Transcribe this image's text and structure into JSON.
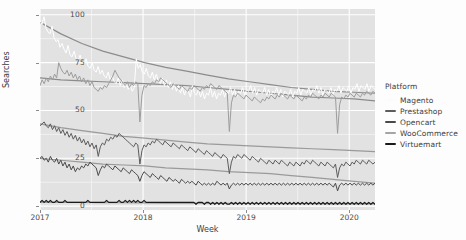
{
  "chart_data": {
    "type": "line",
    "title": "",
    "xlabel": "Week",
    "ylabel": "Searches",
    "xlim": [
      2017.0,
      2020.25
    ],
    "ylim": [
      -2,
      103
    ],
    "xticks": [
      "2017",
      "2018",
      "2019",
      "2020"
    ],
    "xtick_values": [
      2017,
      2018,
      2019,
      2020
    ],
    "yticks": [
      "0",
      "25",
      "50",
      "75",
      "100"
    ],
    "ytick_values": [
      0,
      25,
      50,
      75,
      100
    ],
    "grid": "white major and minor horizontal/vertical gridlines on gray panel",
    "legend_position": "right",
    "legend_title": "Platform",
    "panel_background": "#e2e2e2",
    "series": [
      {
        "name": "Magento",
        "color": "#ffffff",
        "trend_color": "#8c8c8c",
        "trend": [
          96,
          90,
          85,
          81,
          78,
          75,
          72.5,
          70.5,
          68.5,
          66.5,
          65,
          63.5,
          62,
          61,
          60,
          59.5,
          59
        ],
        "values": [
          97,
          95,
          99,
          93,
          91,
          90,
          94,
          88,
          86,
          87,
          83,
          85,
          82,
          80,
          84,
          79,
          78,
          81,
          77,
          76,
          79,
          75,
          74,
          77,
          73,
          72,
          75,
          71,
          70,
          73,
          69,
          71,
          68,
          67,
          70,
          66,
          68,
          65,
          64,
          67,
          63,
          66,
          62,
          64,
          61,
          63,
          60,
          62,
          77,
          72,
          74,
          70,
          69,
          72,
          68,
          67,
          70,
          66,
          69,
          65,
          64,
          67,
          63,
          66,
          62,
          65,
          61,
          64,
          60,
          63,
          59,
          62,
          58,
          61,
          60,
          57,
          63,
          59,
          58,
          61,
          57,
          60,
          56,
          59,
          58,
          62,
          57,
          60,
          56,
          59,
          58,
          61,
          57,
          60,
          59,
          62,
          58,
          61,
          57,
          60,
          59,
          62,
          58,
          61,
          60,
          63,
          59,
          62,
          58,
          61,
          60,
          59,
          62,
          58,
          61,
          57,
          60,
          59,
          62,
          58,
          61,
          57,
          60,
          59,
          58,
          61,
          57,
          60,
          59,
          62,
          58,
          61,
          60,
          59,
          62,
          58,
          61,
          60,
          63,
          59,
          62,
          58,
          61,
          60,
          59,
          62,
          58,
          61,
          60,
          63,
          59,
          62,
          61,
          60,
          63,
          59,
          62,
          61,
          64,
          60,
          63,
          62,
          61,
          64,
          60,
          63,
          62,
          61
        ]
      },
      {
        "name": "Prestashop",
        "color": "#5c5c5c",
        "trend_color": "#9a9a9a",
        "trend": [
          43,
          41,
          39.5,
          38,
          36.5,
          35.5,
          34.5,
          33.5,
          32.5,
          32,
          31.5,
          31,
          30.5,
          30,
          29.5,
          29,
          28.5
        ],
        "values": [
          42,
          43,
          44,
          42,
          41,
          43,
          40,
          42,
          39,
          41,
          38,
          40,
          37,
          39,
          36,
          38,
          35,
          37,
          34,
          36,
          33,
          35,
          32,
          34,
          31,
          33,
          30,
          32,
          26,
          31,
          33,
          32,
          35,
          34,
          36,
          35,
          37,
          36,
          38,
          37,
          36,
          35,
          34,
          33,
          32,
          31,
          33,
          32,
          22,
          29,
          32,
          31,
          33,
          32,
          34,
          33,
          35,
          34,
          33,
          32,
          34,
          33,
          32,
          31,
          33,
          32,
          31,
          30,
          32,
          31,
          30,
          29,
          31,
          30,
          29,
          28,
          30,
          29,
          28,
          27,
          29,
          28,
          27,
          26,
          28,
          27,
          26,
          25,
          27,
          26,
          25,
          17,
          23,
          26,
          25,
          27,
          26,
          25,
          27,
          26,
          25,
          24,
          26,
          25,
          24,
          23,
          25,
          24,
          23,
          22,
          24,
          23,
          22,
          24,
          23,
          22,
          24,
          23,
          22,
          21,
          23,
          22,
          21,
          23,
          22,
          21,
          23,
          22,
          24,
          23,
          22,
          24,
          23,
          22,
          21,
          23,
          22,
          21,
          23,
          22,
          21,
          20,
          22,
          15,
          20,
          22,
          21,
          23,
          22,
          21,
          23,
          22,
          24,
          23,
          22,
          24,
          23,
          22,
          24,
          23,
          22,
          23
        ]
      },
      {
        "name": "Opencart",
        "color": "#4a4a4a",
        "trend_color": "#9a9a9a",
        "trend": [
          25,
          24,
          23,
          22,
          21.5,
          21,
          20,
          19.5,
          19,
          18,
          17.5,
          17,
          16,
          15,
          14,
          13,
          12
        ],
        "values": [
          25,
          26,
          24,
          25,
          23,
          26,
          24,
          23,
          25,
          22,
          24,
          21,
          23,
          20,
          22,
          19,
          21,
          18,
          20,
          19,
          21,
          20,
          22,
          21,
          23,
          22,
          21,
          20,
          16,
          19,
          21,
          20,
          22,
          21,
          20,
          19,
          21,
          20,
          19,
          18,
          20,
          19,
          18,
          17,
          19,
          18,
          17,
          16,
          13,
          16,
          18,
          17,
          16,
          15,
          17,
          16,
          15,
          14,
          16,
          15,
          14,
          13,
          15,
          14,
          13,
          14,
          13,
          12,
          14,
          13,
          12,
          13,
          12,
          13,
          12,
          11,
          13,
          12,
          11,
          12,
          11,
          12,
          11,
          12,
          11,
          13,
          12,
          11,
          12,
          11,
          12,
          9,
          11,
          12,
          11,
          12,
          11,
          12,
          11,
          12,
          11,
          12,
          11,
          12,
          11,
          12,
          11,
          12,
          11,
          12,
          11,
          12,
          11,
          12,
          11,
          12,
          11,
          12,
          11,
          12,
          11,
          12,
          11,
          12,
          11,
          12,
          11,
          12,
          11,
          12,
          11,
          12,
          11,
          12,
          11,
          12,
          11,
          12,
          11,
          12,
          11,
          10,
          12,
          8,
          11,
          12,
          11,
          12,
          11,
          12,
          11,
          12,
          11,
          12,
          11,
          12,
          11,
          12,
          11,
          12,
          11,
          12
        ]
      },
      {
        "name": "WooCommerce",
        "color": "#9d9d9d",
        "trend_color": "#8c8c8c",
        "trend": [
          67,
          66,
          65.5,
          65,
          64.5,
          64,
          63.5,
          63,
          62,
          61,
          60,
          59,
          58,
          57,
          56.5,
          56,
          55
        ],
        "values": [
          63,
          66,
          64,
          67,
          65,
          68,
          66,
          69,
          67,
          75,
          72,
          70,
          69,
          71,
          68,
          70,
          67,
          69,
          66,
          68,
          65,
          67,
          64,
          66,
          63,
          65,
          62,
          61,
          60,
          62,
          61,
          63,
          62,
          64,
          66,
          68,
          71,
          69,
          67,
          66,
          64,
          63,
          65,
          62,
          64,
          63,
          65,
          64,
          44,
          58,
          63,
          62,
          64,
          63,
          65,
          64,
          66,
          65,
          67,
          66,
          65,
          64,
          63,
          62,
          64,
          63,
          62,
          61,
          63,
          62,
          61,
          60,
          62,
          61,
          63,
          62,
          61,
          60,
          62,
          61,
          63,
          62,
          64,
          63,
          62,
          61,
          63,
          62,
          61,
          60,
          59,
          39,
          54,
          58,
          57,
          59,
          58,
          57,
          56,
          58,
          57,
          56,
          55,
          57,
          56,
          55,
          54,
          56,
          55,
          57,
          56,
          58,
          57,
          56,
          58,
          57,
          59,
          58,
          57,
          56,
          58,
          57,
          56,
          58,
          57,
          56,
          55,
          57,
          56,
          58,
          57,
          59,
          58,
          57,
          56,
          58,
          57,
          59,
          58,
          57,
          59,
          58,
          57,
          38,
          53,
          57,
          56,
          58,
          57,
          59,
          58,
          57,
          59,
          58,
          57,
          59,
          58,
          60,
          59,
          58,
          60,
          59
        ]
      },
      {
        "name": "Virtuemart",
        "color": "#1a1a1a",
        "trend_color": "#9a9a9a",
        "trend": [
          2,
          2,
          2,
          1.8,
          1.8,
          1.7,
          1.6,
          1.6,
          1.5,
          1.5,
          1.4,
          1.4,
          1.3,
          1.3,
          1.2,
          1.2,
          1.2
        ],
        "values": [
          2,
          3,
          2,
          3,
          2,
          3,
          2,
          2,
          3,
          2,
          2,
          2,
          3,
          2,
          2,
          2,
          2,
          2,
          2,
          2,
          2,
          2,
          2,
          3,
          2,
          2,
          2,
          2,
          2,
          2,
          2,
          2,
          3,
          2,
          2,
          2,
          2,
          2,
          3,
          2,
          2,
          3,
          2,
          3,
          2,
          3,
          2,
          3,
          2,
          2,
          3,
          2,
          2,
          2,
          2,
          2,
          2,
          2,
          2,
          2,
          2,
          2,
          2,
          2,
          2,
          2,
          2,
          2,
          2,
          2,
          2,
          2,
          2,
          2,
          2,
          1,
          2,
          2,
          2,
          1,
          2,
          2,
          1,
          2,
          1,
          2,
          1,
          2,
          1,
          2,
          1,
          1,
          2,
          1,
          2,
          1,
          2,
          1,
          2,
          1,
          2,
          1,
          2,
          1,
          2,
          1,
          2,
          1,
          2,
          1,
          2,
          1,
          2,
          1,
          2,
          1,
          2,
          1,
          2,
          1,
          2,
          1,
          2,
          1,
          2,
          1,
          2,
          1,
          2,
          1,
          2,
          1,
          2,
          1,
          2,
          1,
          2,
          1,
          2,
          1,
          2,
          1,
          2,
          1,
          2,
          1,
          2,
          1,
          2,
          1,
          2,
          1,
          2,
          1,
          2,
          1,
          2,
          1,
          2,
          1,
          2,
          1
        ]
      }
    ]
  },
  "axes": {
    "ylabel": "Searches",
    "xlabel": "Week",
    "yticks": [
      "100",
      "75",
      "50",
      "25",
      "0"
    ],
    "xticks": [
      "2017",
      "2018",
      "2019",
      "2020"
    ]
  },
  "legend": {
    "title": "Platform",
    "items": [
      {
        "label": "Magento",
        "color": "#fbfbfb"
      },
      {
        "label": "Prestashop",
        "color": "#5c5c5c"
      },
      {
        "label": "Opencart",
        "color": "#4a4a4a"
      },
      {
        "label": "WooCommerce",
        "color": "#a5a5a5"
      },
      {
        "label": "Virtuemart",
        "color": "#1a1a1a"
      }
    ]
  }
}
